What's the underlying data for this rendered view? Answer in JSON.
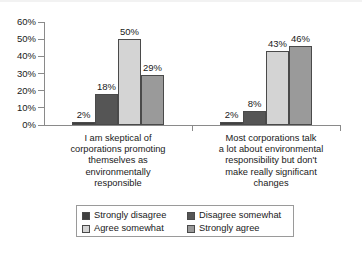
{
  "chart_data": {
    "type": "bar",
    "title": "",
    "xlabel": "",
    "ylabel": "",
    "ylim": [
      0,
      60
    ],
    "grid": false,
    "legend_position": "bottom",
    "ytick_labels": [
      "0%",
      "10%",
      "20%",
      "30%",
      "40%",
      "50%",
      "60%"
    ],
    "ytick_values": [
      0,
      10,
      20,
      30,
      40,
      50,
      60
    ],
    "categories": [
      "I am skeptical of corporations promoting themselves as environmentally responsible",
      "Most corporations talk a lot about environmental responsibility but don't make really significant changes"
    ],
    "category_lines": [
      [
        "I am skeptical of",
        "corporations promoting",
        "themselves as",
        "environmentally",
        "responsible"
      ],
      [
        "Most corporations talk",
        "a lot about environmental",
        "responsibility but don't",
        "make really significant",
        "changes"
      ]
    ],
    "series": [
      {
        "name": "Strongly disagree",
        "color": "#404040",
        "values": [
          2,
          2
        ],
        "labels": [
          "2%",
          "2%"
        ]
      },
      {
        "name": "Disagree somewhat",
        "color": "#555555",
        "values": [
          18,
          8
        ],
        "labels": [
          "18%",
          "8%"
        ]
      },
      {
        "name": "Agree somewhat",
        "color": "#d4d4d4",
        "values": [
          50,
          43
        ],
        "labels": [
          "50%",
          "43%"
        ]
      },
      {
        "name": "Strongly agree",
        "color": "#9a9a9a",
        "values": [
          29,
          46
        ],
        "labels": [
          "29%",
          "46%"
        ]
      }
    ]
  },
  "legend": {
    "items": [
      {
        "label": "Strongly disagree"
      },
      {
        "label": "Disagree somewhat"
      },
      {
        "label": "Agree somewhat"
      },
      {
        "label": "Strongly agree"
      }
    ]
  }
}
